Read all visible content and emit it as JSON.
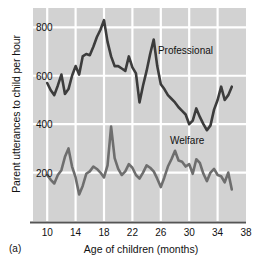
{
  "panel": {
    "label": "(a)"
  },
  "chart_data": {
    "type": "line",
    "title": "",
    "xlabel": "Age of children (months)",
    "ylabel": "Parent utterances to child per hour",
    "xlim": [
      8,
      38
    ],
    "ylim": [
      0,
      880
    ],
    "xticks": [
      10,
      14,
      18,
      22,
      26,
      30,
      34,
      38
    ],
    "yticks": [
      200,
      400,
      600,
      800
    ],
    "xtick_labels": [
      "10",
      "14",
      "18",
      "22",
      "26",
      "30",
      "34",
      "38"
    ],
    "ytick_labels": [
      "200",
      "400",
      "600",
      "800"
    ],
    "grid": true,
    "grid_color": "#ffffff",
    "plot_background": "#d2d2d2",
    "legend": "inline-annotations",
    "series": [
      {
        "name": "Professional",
        "color": "#3c3c3c",
        "label_x": 25.6,
        "label_y": 690,
        "x": [
          10,
          10.5,
          11,
          11.5,
          12,
          12.5,
          13,
          13.5,
          14,
          14.5,
          15,
          15.5,
          16,
          16.5,
          17,
          17.5,
          18,
          18.5,
          19,
          19.5,
          20,
          20.5,
          21,
          21.5,
          22,
          22.5,
          23,
          23.5,
          24,
          24.5,
          25,
          25.5,
          26,
          26.5,
          27,
          27.5,
          28,
          28.5,
          29,
          29.5,
          30,
          30.5,
          31,
          31.5,
          32,
          32.5,
          33,
          33.5,
          34,
          34.5,
          35,
          35.5,
          36
        ],
        "values": [
          570,
          540,
          520,
          560,
          605,
          525,
          545,
          600,
          640,
          605,
          680,
          690,
          685,
          720,
          760,
          790,
          830,
          740,
          680,
          640,
          640,
          630,
          620,
          680,
          635,
          610,
          490,
          560,
          620,
          690,
          750,
          640,
          565,
          545,
          520,
          505,
          490,
          470,
          455,
          440,
          400,
          415,
          465,
          430,
          400,
          375,
          395,
          460,
          500,
          555,
          500,
          520,
          555
        ]
      },
      {
        "name": "Welfare",
        "color": "#6e6e6e",
        "label_x": 27.3,
        "label_y": 318,
        "x": [
          10,
          10.5,
          11,
          11.5,
          12,
          12.5,
          13,
          13.5,
          14,
          14.5,
          15,
          15.5,
          16,
          16.5,
          17,
          17.5,
          18,
          18.5,
          19,
          19.5,
          20,
          20.5,
          21,
          21.5,
          22,
          22.5,
          23,
          23.5,
          24,
          24.5,
          25,
          25.5,
          26,
          26.5,
          27,
          27.5,
          28,
          28.5,
          29,
          29.5,
          30,
          30.5,
          31,
          31.5,
          32,
          32.5,
          33,
          33.5,
          34,
          34.5,
          35,
          35.5,
          36
        ],
        "values": [
          190,
          170,
          155,
          190,
          210,
          265,
          300,
          225,
          180,
          110,
          145,
          195,
          205,
          225,
          215,
          200,
          180,
          230,
          390,
          260,
          215,
          190,
          205,
          235,
          220,
          190,
          175,
          200,
          230,
          220,
          205,
          175,
          140,
          180,
          225,
          255,
          290,
          250,
          245,
          225,
          235,
          195,
          255,
          240,
          195,
          165,
          200,
          215,
          190,
          185,
          160,
          200,
          130
        ]
      }
    ]
  }
}
